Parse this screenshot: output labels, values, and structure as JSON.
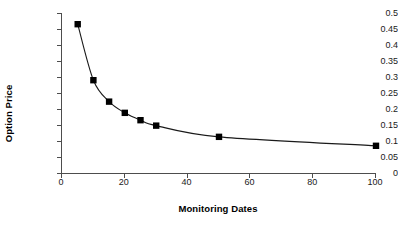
{
  "chart_data": {
    "type": "line",
    "title": "",
    "xlabel": "Monitoring Dates",
    "ylabel": "Option Price",
    "x": [
      5,
      10,
      15,
      20,
      25,
      30,
      50,
      100
    ],
    "values": [
      0.465,
      0.29,
      0.223,
      0.188,
      0.165,
      0.148,
      0.113,
      0.085
    ],
    "series": [
      {
        "name": "Option Price",
        "values": [
          0.465,
          0.29,
          0.223,
          0.188,
          0.165,
          0.148,
          0.113,
          0.085
        ]
      }
    ],
    "xlim": [
      0,
      100
    ],
    "ylim": [
      0,
      0.5
    ],
    "xticks": [
      0,
      20,
      40,
      60,
      80,
      100
    ],
    "xtick_labels": [
      "0",
      "20",
      "40",
      "60",
      "80",
      "100"
    ],
    "yticks": [
      0,
      0.05,
      0.1,
      0.15,
      0.2,
      0.25,
      0.3,
      0.35,
      0.4,
      0.45,
      0.5
    ],
    "ytick_labels": [
      "0",
      "0.05",
      "0.1",
      "0.15",
      "0.2",
      "0.25",
      "0.3",
      "0.35",
      "0.4",
      "0.45",
      "0.5"
    ],
    "grid": false,
    "legend": false,
    "legend_position": "none",
    "marker": "square",
    "marker_color": "#000000",
    "line_color": "#1a1a1a",
    "axis_color": "#4d4d4d",
    "background_color": "#ffffff"
  }
}
